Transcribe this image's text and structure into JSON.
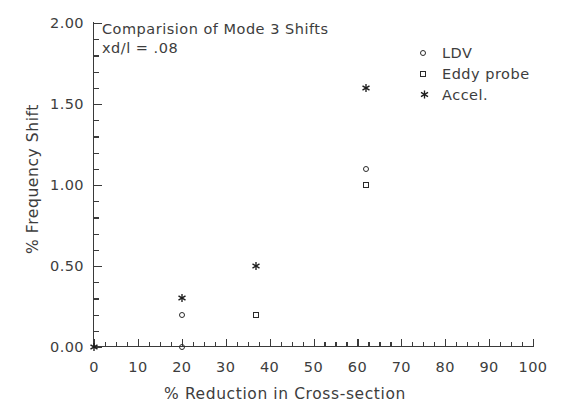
{
  "chart_data": {
    "type": "scatter",
    "title": "",
    "annotation_lines": [
      "Comparision of Mode 3 Shifts",
      "xd/l = .08"
    ],
    "xlabel": "% Reduction in Cross-section",
    "ylabel": "% Frequency Shift",
    "xlim": [
      0,
      100
    ],
    "ylim": [
      0.0,
      2.0
    ],
    "xticks": [
      0,
      10,
      20,
      30,
      40,
      50,
      60,
      70,
      80,
      90,
      100
    ],
    "xticklabels": [
      "0",
      "10",
      "20",
      "30",
      "40",
      "50",
      "60",
      "70",
      "80",
      "90",
      "100"
    ],
    "x_minor_interval": 2.5,
    "yticks": [
      0.0,
      0.5,
      1.0,
      1.5,
      2.0
    ],
    "yticklabels": [
      "0.00",
      "0.50",
      "1.00",
      "1.50",
      "2.00"
    ],
    "y_minor_interval": 0.1,
    "grid": false,
    "legend_position": "upper right",
    "series": [
      {
        "name": "LDV",
        "marker": "circle",
        "points": [
          {
            "x": 20,
            "y": 0.0
          },
          {
            "x": 20,
            "y": 0.2
          },
          {
            "x": 62,
            "y": 1.1
          }
        ]
      },
      {
        "name": "Eddy probe",
        "marker": "square",
        "points": [
          {
            "x": 37,
            "y": 0.2
          },
          {
            "x": 62,
            "y": 1.0
          }
        ]
      },
      {
        "name": "Accel.",
        "marker": "asterisk",
        "points": [
          {
            "x": 0,
            "y": 0.0
          },
          {
            "x": 20,
            "y": 0.3
          },
          {
            "x": 37,
            "y": 0.5
          },
          {
            "x": 62,
            "y": 1.6
          }
        ]
      }
    ]
  },
  "legend": {
    "entries": [
      {
        "label": "LDV",
        "marker": "circle-marker-icon"
      },
      {
        "label": "Eddy probe",
        "marker": "square-marker-icon"
      },
      {
        "label": "Accel.",
        "marker": "asterisk-marker-icon"
      }
    ]
  },
  "colors": {
    "axis": "#3a3a3a",
    "text": "#3d3d3d",
    "marker": "#2a2a2a",
    "background": "#ffffff"
  }
}
